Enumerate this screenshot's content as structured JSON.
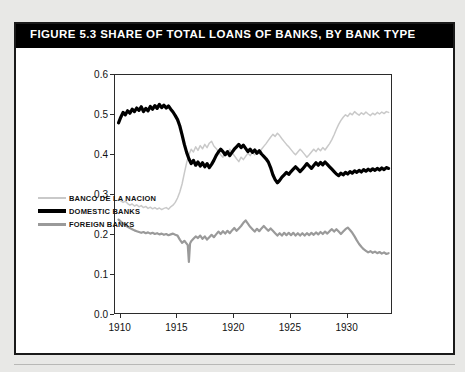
{
  "figure": {
    "title": "FIGURE 5.3  SHARE OF TOTAL LOANS OF BANKS, BY BANK TYPE"
  },
  "legend": {
    "items": [
      {
        "label": "BANCO DE LA NACION",
        "color": "#c9c9c9",
        "thickness": 2
      },
      {
        "label": "DOMESTIC BANKS",
        "color": "#000000",
        "thickness": 4
      },
      {
        "label": "FOREIGN BANKS",
        "color": "#9a9a9a",
        "thickness": 3
      }
    ]
  },
  "chart_data": {
    "type": "line",
    "title": "SHARE OF TOTAL LOANS OF BANKS, BY BANK TYPE",
    "xlabel": "",
    "ylabel": "",
    "xlim": [
      1909.5,
      1934.0
    ],
    "ylim": [
      0.0,
      0.6
    ],
    "grid": false,
    "legend_position": "bottom-left-inside",
    "xticks": [
      1910,
      1915,
      1920,
      1925,
      1930
    ],
    "xtick_labels": [
      "1910",
      "1915",
      "1920",
      "1925",
      "1930"
    ],
    "yticks": [
      0.0,
      0.1,
      0.2,
      0.3,
      0.4,
      0.5,
      0.6
    ],
    "ytick_labels": [
      "0.0",
      "0.1",
      "0.2",
      "0.3",
      "0.4",
      "0.5",
      "0.6"
    ],
    "series": [
      {
        "name": "BANCO DE LA NACION",
        "color": "#c9c9c9",
        "thickness": 1.5,
        "x": [
          1909.9,
          1910.1,
          1910.3,
          1910.5,
          1910.7,
          1910.9,
          1911.1,
          1911.3,
          1911.5,
          1911.7,
          1911.9,
          1912.1,
          1912.3,
          1912.5,
          1912.7,
          1912.9,
          1913.1,
          1913.3,
          1913.5,
          1913.7,
          1913.9,
          1914.1,
          1914.3,
          1914.5,
          1914.7,
          1914.9,
          1915.1,
          1915.3,
          1915.5,
          1915.7,
          1915.9,
          1916.1,
          1916.3,
          1916.5,
          1916.7,
          1916.9,
          1917.1,
          1917.3,
          1917.5,
          1917.7,
          1917.9,
          1918.1,
          1918.3,
          1918.5,
          1918.7,
          1918.9,
          1919.1,
          1919.3,
          1919.5,
          1919.7,
          1919.9,
          1920.1,
          1920.3,
          1920.5,
          1920.7,
          1920.9,
          1921.1,
          1921.3,
          1921.5,
          1921.7,
          1921.9,
          1922.1,
          1922.3,
          1922.5,
          1922.7,
          1922.9,
          1923.1,
          1923.3,
          1923.5,
          1923.7,
          1923.9,
          1924.1,
          1924.3,
          1924.5,
          1924.7,
          1924.9,
          1925.1,
          1925.3,
          1925.5,
          1925.7,
          1925.9,
          1926.1,
          1926.3,
          1926.5,
          1926.7,
          1926.9,
          1927.1,
          1927.3,
          1927.5,
          1927.7,
          1927.9,
          1928.1,
          1928.3,
          1928.5,
          1928.7,
          1928.9,
          1929.1,
          1929.3,
          1929.5,
          1929.7,
          1929.9,
          1930.1,
          1930.3,
          1930.5,
          1930.7,
          1930.9,
          1931.1,
          1931.3,
          1931.5,
          1931.7,
          1931.9,
          1932.1,
          1932.3,
          1932.5,
          1932.7,
          1932.9,
          1933.1,
          1933.3,
          1933.5,
          1933.7
        ],
        "y": [
          0.287,
          0.283,
          0.279,
          0.282,
          0.276,
          0.272,
          0.275,
          0.27,
          0.273,
          0.268,
          0.271,
          0.266,
          0.269,
          0.264,
          0.267,
          0.263,
          0.266,
          0.262,
          0.265,
          0.261,
          0.264,
          0.266,
          0.262,
          0.268,
          0.272,
          0.279,
          0.29,
          0.305,
          0.325,
          0.352,
          0.378,
          0.398,
          0.412,
          0.405,
          0.418,
          0.409,
          0.421,
          0.413,
          0.424,
          0.416,
          0.427,
          0.432,
          0.42,
          0.414,
          0.406,
          0.398,
          0.392,
          0.405,
          0.398,
          0.412,
          0.404,
          0.396,
          0.388,
          0.381,
          0.392,
          0.386,
          0.394,
          0.402,
          0.396,
          0.404,
          0.398,
          0.408,
          0.401,
          0.412,
          0.419,
          0.426,
          0.434,
          0.442,
          0.449,
          0.444,
          0.452,
          0.446,
          0.438,
          0.431,
          0.424,
          0.418,
          0.411,
          0.404,
          0.398,
          0.405,
          0.412,
          0.406,
          0.399,
          0.392,
          0.398,
          0.405,
          0.412,
          0.406,
          0.414,
          0.408,
          0.416,
          0.41,
          0.418,
          0.426,
          0.436,
          0.448,
          0.462,
          0.474,
          0.484,
          0.492,
          0.498,
          0.494,
          0.502,
          0.498,
          0.506,
          0.501,
          0.497,
          0.503,
          0.499,
          0.505,
          0.5,
          0.496,
          0.502,
          0.498,
          0.504,
          0.5,
          0.505,
          0.501,
          0.506,
          0.504
        ]
      },
      {
        "name": "DOMESTIC BANKS",
        "color": "#000000",
        "thickness": 3.2,
        "x": [
          1909.9,
          1910.1,
          1910.3,
          1910.5,
          1910.7,
          1910.9,
          1911.1,
          1911.3,
          1911.5,
          1911.7,
          1911.9,
          1912.1,
          1912.3,
          1912.5,
          1912.7,
          1912.9,
          1913.1,
          1913.3,
          1913.5,
          1913.7,
          1913.9,
          1914.1,
          1914.3,
          1914.5,
          1914.7,
          1914.9,
          1915.1,
          1915.3,
          1915.5,
          1915.7,
          1915.9,
          1916.1,
          1916.3,
          1916.5,
          1916.7,
          1916.9,
          1917.1,
          1917.3,
          1917.5,
          1917.7,
          1917.9,
          1918.1,
          1918.3,
          1918.5,
          1918.7,
          1918.9,
          1919.1,
          1919.3,
          1919.5,
          1919.7,
          1919.9,
          1920.1,
          1920.3,
          1920.5,
          1920.7,
          1920.9,
          1921.1,
          1921.3,
          1921.5,
          1921.7,
          1921.9,
          1922.1,
          1922.3,
          1922.5,
          1922.7,
          1922.9,
          1923.1,
          1923.3,
          1923.5,
          1923.7,
          1923.9,
          1924.1,
          1924.3,
          1924.5,
          1924.7,
          1924.9,
          1925.1,
          1925.3,
          1925.5,
          1925.7,
          1925.9,
          1926.1,
          1926.3,
          1926.5,
          1926.7,
          1926.9,
          1927.1,
          1927.3,
          1927.5,
          1927.7,
          1927.9,
          1928.1,
          1928.3,
          1928.5,
          1928.7,
          1928.9,
          1929.1,
          1929.3,
          1929.5,
          1929.7,
          1929.9,
          1930.1,
          1930.3,
          1930.5,
          1930.7,
          1930.9,
          1931.1,
          1931.3,
          1931.5,
          1931.7,
          1931.9,
          1932.1,
          1932.3,
          1932.5,
          1932.7,
          1932.9,
          1933.1,
          1933.3,
          1933.5,
          1933.7
        ],
        "y": [
          0.478,
          0.492,
          0.504,
          0.498,
          0.508,
          0.502,
          0.512,
          0.506,
          0.515,
          0.509,
          0.518,
          0.506,
          0.514,
          0.508,
          0.519,
          0.512,
          0.521,
          0.514,
          0.524,
          0.516,
          0.522,
          0.515,
          0.52,
          0.512,
          0.505,
          0.496,
          0.486,
          0.47,
          0.448,
          0.424,
          0.404,
          0.388,
          0.376,
          0.384,
          0.372,
          0.38,
          0.37,
          0.378,
          0.368,
          0.376,
          0.366,
          0.374,
          0.384,
          0.396,
          0.405,
          0.412,
          0.406,
          0.398,
          0.406,
          0.396,
          0.404,
          0.412,
          0.418,
          0.424,
          0.416,
          0.422,
          0.414,
          0.406,
          0.412,
          0.404,
          0.41,
          0.402,
          0.408,
          0.4,
          0.394,
          0.388,
          0.38,
          0.366,
          0.348,
          0.336,
          0.328,
          0.334,
          0.342,
          0.348,
          0.354,
          0.349,
          0.356,
          0.362,
          0.368,
          0.362,
          0.356,
          0.362,
          0.369,
          0.376,
          0.37,
          0.364,
          0.371,
          0.378,
          0.372,
          0.379,
          0.373,
          0.38,
          0.374,
          0.368,
          0.362,
          0.356,
          0.35,
          0.346,
          0.352,
          0.348,
          0.354,
          0.35,
          0.356,
          0.352,
          0.358,
          0.354,
          0.359,
          0.355,
          0.361,
          0.357,
          0.362,
          0.358,
          0.363,
          0.359,
          0.364,
          0.36,
          0.365,
          0.361,
          0.366,
          0.364
        ]
      },
      {
        "name": "FOREIGN BANKS",
        "color": "#9a9a9a",
        "thickness": 2.2,
        "x": [
          1909.9,
          1910.1,
          1910.3,
          1910.5,
          1910.7,
          1910.9,
          1911.1,
          1911.3,
          1911.5,
          1911.7,
          1911.9,
          1912.1,
          1912.3,
          1912.5,
          1912.7,
          1912.9,
          1913.1,
          1913.3,
          1913.5,
          1913.7,
          1913.9,
          1914.1,
          1914.3,
          1914.5,
          1914.7,
          1914.9,
          1915.1,
          1915.3,
          1915.5,
          1915.7,
          1915.9,
          1916.0,
          1916.1,
          1916.2,
          1916.3,
          1916.5,
          1916.7,
          1916.9,
          1917.1,
          1917.3,
          1917.5,
          1917.7,
          1917.9,
          1918.1,
          1918.3,
          1918.5,
          1918.7,
          1918.9,
          1919.1,
          1919.3,
          1919.5,
          1919.7,
          1919.9,
          1920.1,
          1920.3,
          1920.5,
          1920.7,
          1920.9,
          1921.1,
          1921.3,
          1921.5,
          1921.7,
          1921.9,
          1922.1,
          1922.3,
          1922.5,
          1922.7,
          1922.9,
          1923.1,
          1923.3,
          1923.5,
          1923.7,
          1923.9,
          1924.1,
          1924.3,
          1924.5,
          1924.7,
          1924.9,
          1925.1,
          1925.3,
          1925.5,
          1925.7,
          1925.9,
          1926.1,
          1926.3,
          1926.5,
          1926.7,
          1926.9,
          1927.1,
          1927.3,
          1927.5,
          1927.7,
          1927.9,
          1928.1,
          1928.3,
          1928.5,
          1928.7,
          1928.9,
          1929.1,
          1929.3,
          1929.5,
          1929.7,
          1929.9,
          1930.1,
          1930.3,
          1930.5,
          1930.7,
          1930.9,
          1931.1,
          1931.3,
          1931.5,
          1931.7,
          1931.9,
          1932.1,
          1932.3,
          1932.5,
          1932.7,
          1932.9,
          1933.1,
          1933.3,
          1933.5,
          1933.7
        ],
        "y": [
          0.236,
          0.231,
          0.226,
          0.222,
          0.218,
          0.215,
          0.212,
          0.209,
          0.207,
          0.205,
          0.203,
          0.205,
          0.202,
          0.204,
          0.201,
          0.203,
          0.2,
          0.202,
          0.199,
          0.201,
          0.198,
          0.2,
          0.197,
          0.199,
          0.201,
          0.198,
          0.196,
          0.186,
          0.178,
          0.183,
          0.176,
          0.172,
          0.13,
          0.176,
          0.182,
          0.188,
          0.194,
          0.19,
          0.196,
          0.188,
          0.194,
          0.186,
          0.192,
          0.198,
          0.192,
          0.199,
          0.206,
          0.2,
          0.207,
          0.201,
          0.208,
          0.202,
          0.209,
          0.215,
          0.208,
          0.214,
          0.22,
          0.228,
          0.234,
          0.226,
          0.218,
          0.212,
          0.206,
          0.213,
          0.207,
          0.214,
          0.22,
          0.214,
          0.208,
          0.214,
          0.208,
          0.202,
          0.196,
          0.202,
          0.196,
          0.203,
          0.197,
          0.203,
          0.197,
          0.203,
          0.196,
          0.202,
          0.196,
          0.202,
          0.196,
          0.202,
          0.197,
          0.203,
          0.198,
          0.204,
          0.199,
          0.205,
          0.2,
          0.206,
          0.201,
          0.207,
          0.212,
          0.206,
          0.212,
          0.206,
          0.2,
          0.206,
          0.212,
          0.216,
          0.21,
          0.203,
          0.194,
          0.184,
          0.175,
          0.168,
          0.162,
          0.158,
          0.154,
          0.157,
          0.153,
          0.156,
          0.152,
          0.155,
          0.151,
          0.154,
          0.15,
          0.152
        ]
      }
    ]
  }
}
